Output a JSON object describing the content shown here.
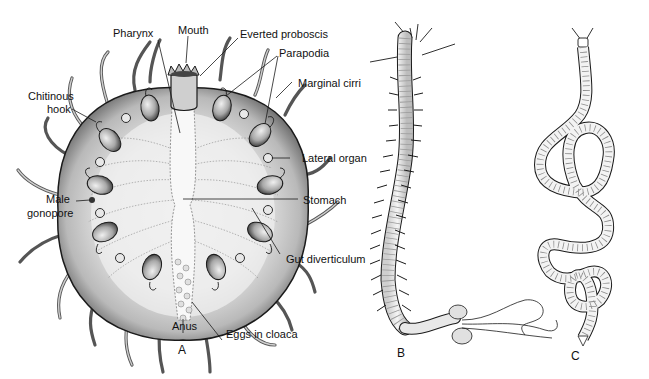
{
  "figure": {
    "panels": [
      {
        "id": "A",
        "label": "A",
        "subject": "disc-shaped polychaete, ventral view"
      },
      {
        "id": "B",
        "label": "B",
        "subject": "elongate polychaete worm with long posterior cirri"
      },
      {
        "id": "C",
        "label": "C",
        "subject": "slender coiled worm"
      }
    ],
    "annotations": {
      "mouth": "Mouth",
      "pharynx": "Pharynx",
      "everted_proboscis": "Everted proboscis",
      "parapodia": "Parapodia",
      "marginal_cirri": "Marginal cirri",
      "chitinous_hook_line1": "Chitinous",
      "chitinous_hook_line2": "hook",
      "lateral_organ": "Lateral organ",
      "male_gonopore_line1": "Male",
      "male_gonopore_line2": "gonopore",
      "stomach": "Stomach",
      "gut_diverticulum": "Gut diverticulum",
      "anus": "Anus",
      "eggs_in_cloaca": "Eggs in cloaca"
    },
    "colors": {
      "ink": "#1a1a1a",
      "body_fill": "#e4e4e4",
      "body_light": "#f2f2f2",
      "shade": "#9a9a9a",
      "background": "#ffffff"
    }
  }
}
